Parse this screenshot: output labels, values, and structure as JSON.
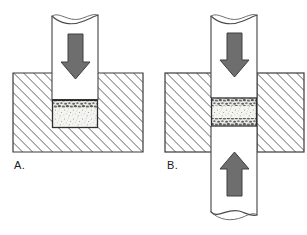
{
  "figure": {
    "background_color": "#ffffff",
    "outline_color": "#3a3a3a",
    "hatch_color": "#2e2e2e",
    "arrow_color": "#6e6e6e",
    "arrow_outline_color": "#3a3a3a",
    "specimen_fill_color": "#f4f4f0",
    "specimen_band_color": "#6b6b6b",
    "cylinder_fill_color": "#ffffff"
  },
  "panels": [
    {
      "id": "A",
      "label": "A.",
      "caption": "Single-ended compression: piston presses granular specimen into a blind cavity in a solid hatched block.",
      "block": {
        "name": "hatched-block",
        "count": 1,
        "arrangement": "single-solid-block-with-blind-cavity",
        "hatch_angle_deg": 45,
        "hatch_spacing_px": 5
      },
      "cylinders": [
        {
          "name": "upper-piston",
          "direction": "from-top",
          "end_style": "broken-wavy-cutaway",
          "arrow": {
            "name": "load-arrow-down",
            "direction": "down",
            "label": ""
          }
        }
      ],
      "specimen": {
        "name": "granular-specimen",
        "bands": [
          "top"
        ],
        "fill": "fine-stipple"
      }
    },
    {
      "id": "B",
      "label": "B.",
      "caption": "Double-ended compression: specimen squeezed between two opposing pistons passing through a split hatched block.",
      "block": {
        "name": "hatched-block",
        "count": 2,
        "arrangement": "split-left-and-right-blocks",
        "hatch_angle_deg": 45,
        "hatch_spacing_px": 5
      },
      "cylinders": [
        {
          "name": "upper-piston",
          "direction": "from-top",
          "end_style": "broken-wavy-cutaway",
          "arrow": {
            "name": "load-arrow-down",
            "direction": "down",
            "label": ""
          }
        },
        {
          "name": "lower-piston",
          "direction": "from-bottom",
          "end_style": "broken-wavy-cutaway",
          "arrow": {
            "name": "load-arrow-up",
            "direction": "up",
            "label": ""
          }
        }
      ],
      "specimen": {
        "name": "granular-specimen",
        "bands": [
          "top",
          "bottom"
        ],
        "fill": "fine-stipple"
      }
    }
  ]
}
